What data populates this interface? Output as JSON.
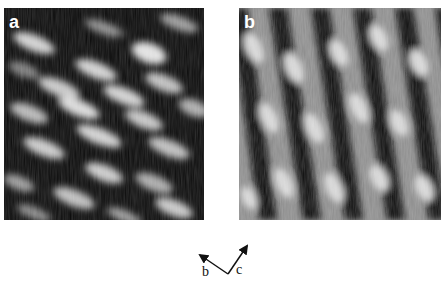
{
  "panels": [
    {
      "label": "a",
      "description": "STM image with bright elongated blobs tilted along lattice rows, dark background"
    },
    {
      "label": "b",
      "description": "STM image with bright/dark diagonal stripes running from top-left to bottom-right"
    }
  ],
  "axes": {
    "left_label": "b",
    "right_label": "c"
  }
}
